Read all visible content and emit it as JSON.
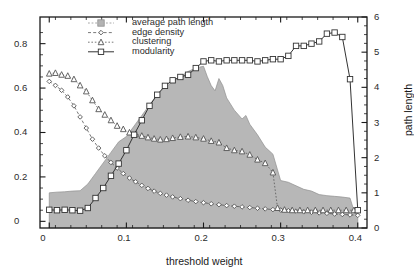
{
  "chart_data": {
    "type": "area",
    "title": "",
    "xlabel": "threshold weight",
    "ylabel": "",
    "ylabel_right": "path length",
    "xlim": [
      -0.012,
      0.412
    ],
    "ylim": [
      -0.03,
      0.92
    ],
    "ylim_right": [
      0,
      6
    ],
    "xticks": [
      0,
      0.1,
      0.2,
      0.3,
      0.4
    ],
    "xticklabels": [
      "0",
      "0.1",
      "0.2",
      "0.3",
      "0.4"
    ],
    "yticks": [
      0,
      0.2,
      0.4,
      0.6,
      0.8
    ],
    "yticklabels": [
      "0",
      "0.2",
      "0.4",
      "0.6",
      "0.8"
    ],
    "yticks_right": [
      0,
      1,
      2,
      3,
      4,
      5,
      6
    ],
    "yticklabels_right": [
      "0",
      "1",
      "2",
      "3",
      "4",
      "5",
      "6"
    ],
    "minor_tick_step_x": 0.02,
    "minor_tick_step_y": 0.05,
    "minor_tick_step_y_right": 0.25,
    "grid": false,
    "legend_position": "top-center",
    "legend": [
      {
        "label": "average path length",
        "marker": "square-filled",
        "style": "shaded-area",
        "color": "#b3b3b3",
        "axis": "right"
      },
      {
        "label": "edge density",
        "marker": "diamond",
        "style": "dashed",
        "color": "#555555",
        "axis": "left"
      },
      {
        "label": "clustering",
        "marker": "triangle",
        "style": "dotted",
        "color": "#555555",
        "axis": "left"
      },
      {
        "label": "modularity",
        "marker": "square",
        "style": "solid",
        "color": "#333333",
        "axis": "left"
      }
    ],
    "series": [
      {
        "name": "average path length",
        "axis": "right",
        "x": [
          0.0,
          0.01,
          0.02,
          0.03,
          0.04,
          0.05,
          0.06,
          0.07,
          0.08,
          0.09,
          0.1,
          0.11,
          0.12,
          0.13,
          0.14,
          0.15,
          0.16,
          0.17,
          0.18,
          0.19,
          0.2,
          0.205,
          0.21,
          0.215,
          0.22,
          0.225,
          0.23,
          0.24,
          0.25,
          0.255,
          0.26,
          0.27,
          0.28,
          0.29,
          0.3,
          0.31,
          0.32,
          0.33,
          0.34,
          0.35,
          0.36,
          0.37,
          0.38,
          0.39,
          0.395,
          0.4
        ],
        "values": [
          1.0,
          1.02,
          1.03,
          1.05,
          1.06,
          1.25,
          1.55,
          1.85,
          2.15,
          2.45,
          2.6,
          2.9,
          3.2,
          3.5,
          3.8,
          4.0,
          4.15,
          4.3,
          4.45,
          4.55,
          4.6,
          4.3,
          4.05,
          3.9,
          4.25,
          4.05,
          3.7,
          3.35,
          3.1,
          3.2,
          2.95,
          2.65,
          2.3,
          2.1,
          1.35,
          1.3,
          1.2,
          1.1,
          1.05,
          0.95,
          0.92,
          0.9,
          0.88,
          0.85,
          0.5,
          0.4
        ]
      },
      {
        "name": "edge density",
        "axis": "left",
        "x": [
          0.0,
          0.008,
          0.016,
          0.024,
          0.032,
          0.04,
          0.048,
          0.056,
          0.064,
          0.072,
          0.08,
          0.088,
          0.096,
          0.104,
          0.112,
          0.12,
          0.128,
          0.136,
          0.144,
          0.152,
          0.16,
          0.17,
          0.18,
          0.19,
          0.2,
          0.21,
          0.22,
          0.23,
          0.24,
          0.25,
          0.26,
          0.27,
          0.28,
          0.29,
          0.3,
          0.31,
          0.32,
          0.33,
          0.34,
          0.35,
          0.36,
          0.37,
          0.38,
          0.39,
          0.4
        ],
        "values": [
          0.63,
          0.612,
          0.59,
          0.56,
          0.52,
          0.47,
          0.42,
          0.37,
          0.33,
          0.295,
          0.265,
          0.24,
          0.215,
          0.195,
          0.178,
          0.162,
          0.148,
          0.136,
          0.126,
          0.118,
          0.11,
          0.102,
          0.095,
          0.089,
          0.084,
          0.079,
          0.075,
          0.071,
          0.068,
          0.065,
          0.062,
          0.059,
          0.056,
          0.053,
          0.051,
          0.048,
          0.046,
          0.043,
          0.041,
          0.038,
          0.036,
          0.033,
          0.031,
          0.029,
          0.027
        ]
      },
      {
        "name": "clustering",
        "axis": "left",
        "x": [
          0.0,
          0.008,
          0.016,
          0.024,
          0.032,
          0.04,
          0.048,
          0.056,
          0.064,
          0.072,
          0.08,
          0.088,
          0.096,
          0.104,
          0.112,
          0.12,
          0.128,
          0.136,
          0.144,
          0.152,
          0.16,
          0.17,
          0.18,
          0.19,
          0.2,
          0.21,
          0.22,
          0.23,
          0.24,
          0.25,
          0.26,
          0.27,
          0.28,
          0.29,
          0.296,
          0.305,
          0.315,
          0.325,
          0.335,
          0.345,
          0.355,
          0.365,
          0.375,
          0.385,
          0.395
        ],
        "values": [
          0.665,
          0.668,
          0.66,
          0.655,
          0.64,
          0.612,
          0.585,
          0.545,
          0.505,
          0.48,
          0.455,
          0.43,
          0.415,
          0.4,
          0.392,
          0.385,
          0.378,
          0.372,
          0.368,
          0.37,
          0.375,
          0.38,
          0.382,
          0.378,
          0.372,
          0.362,
          0.355,
          0.33,
          0.32,
          0.315,
          0.3,
          0.278,
          0.262,
          0.22,
          0.06,
          0.052,
          0.05,
          0.05,
          0.05,
          0.05,
          0.05,
          0.05,
          0.05,
          0.05,
          0.05
        ]
      },
      {
        "name": "modularity",
        "axis": "left",
        "x": [
          0.0,
          0.01,
          0.02,
          0.03,
          0.04,
          0.05,
          0.06,
          0.07,
          0.08,
          0.09,
          0.1,
          0.11,
          0.12,
          0.13,
          0.14,
          0.15,
          0.16,
          0.17,
          0.18,
          0.19,
          0.2,
          0.21,
          0.22,
          0.23,
          0.24,
          0.25,
          0.26,
          0.27,
          0.28,
          0.29,
          0.3,
          0.31,
          0.32,
          0.33,
          0.34,
          0.35,
          0.36,
          0.37,
          0.38,
          0.39,
          0.4
        ],
        "values": [
          0.052,
          0.05,
          0.052,
          0.05,
          0.048,
          0.06,
          0.105,
          0.15,
          0.205,
          0.26,
          0.32,
          0.39,
          0.455,
          0.52,
          0.57,
          0.61,
          0.635,
          0.65,
          0.66,
          0.69,
          0.72,
          0.725,
          0.72,
          0.725,
          0.725,
          0.725,
          0.725,
          0.72,
          0.725,
          0.73,
          0.73,
          0.745,
          0.79,
          0.79,
          0.8,
          0.81,
          0.845,
          0.85,
          0.83,
          0.64,
          0.05
        ]
      }
    ]
  },
  "colors": {
    "area_fill": "#b3b3b3",
    "area_edge": "#8f8f8f",
    "line_dark": "#333333",
    "line_mid": "#555555",
    "axis": "#1a1a1a",
    "background": "#ffffff"
  }
}
